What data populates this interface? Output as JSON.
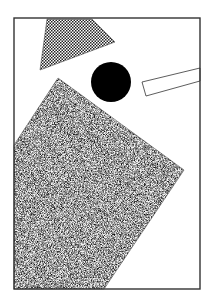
{
  "artwork": {
    "width": 211,
    "height": 308,
    "background": "#ffffff",
    "frame": {
      "x": 14,
      "y": 18,
      "width": 186,
      "height": 271,
      "stroke": "#333333"
    },
    "shapes": [
      {
        "name": "checkered-trapezoid",
        "fill": "checker",
        "points": "47,19 92,19 115,42 40,70"
      },
      {
        "name": "black-circle",
        "fill": "#000000",
        "cx": 111,
        "cy": 82,
        "r": 20
      },
      {
        "name": "outlined-bar",
        "fill": "#ffffff",
        "stroke": "#333333",
        "points": "142,82 200,68 200,81 146,96"
      },
      {
        "name": "stippled-polygon",
        "fill": "stipple",
        "points": "58,78 184,170 104,289 14,289 14,145"
      }
    ]
  }
}
